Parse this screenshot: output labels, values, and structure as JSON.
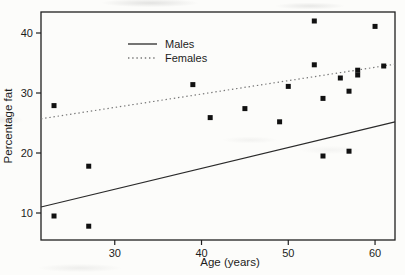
{
  "chart_data": {
    "type": "scatter",
    "title": "",
    "xlabel": "Age (years)",
    "ylabel": "Percentage fat",
    "xlim": [
      21.5,
      62.3
    ],
    "ylim": [
      5.5,
      43.5
    ],
    "x_ticks": [
      30,
      40,
      50,
      60
    ],
    "y_ticks": [
      10,
      20,
      30,
      40
    ],
    "grid": false,
    "legend_position": "upper-left-inside",
    "marker": "filled-black-square",
    "marker_size_px": 5,
    "points": [
      [
        23,
        9.5
      ],
      [
        23,
        27.9
      ],
      [
        27,
        7.8
      ],
      [
        27,
        17.8
      ],
      [
        39,
        31.4
      ],
      [
        41,
        25.9
      ],
      [
        45,
        27.4
      ],
      [
        49,
        25.2
      ],
      [
        50,
        31.1
      ],
      [
        53,
        34.7
      ],
      [
        53,
        42.0
      ],
      [
        54,
        19.5
      ],
      [
        54,
        29.1
      ],
      [
        56,
        32.5
      ],
      [
        57,
        20.3
      ],
      [
        57,
        30.3
      ],
      [
        58,
        33.0
      ],
      [
        58,
        33.8
      ],
      [
        60,
        41.1
      ],
      [
        61,
        34.5
      ]
    ],
    "series": [
      {
        "name": "Males",
        "line_style": "solid",
        "line_color": "#2a2a2a",
        "trend_x": [
          21.5,
          62.3
        ],
        "trend_y": [
          11.0,
          25.2
        ]
      },
      {
        "name": "Females",
        "line_style": "dotted",
        "line_color": "#777777",
        "trend_x": [
          21.5,
          62.3
        ],
        "trend_y": [
          25.7,
          34.8
        ]
      }
    ],
    "colors": {
      "marker": "#111111",
      "frame": "#1f1f1f",
      "background": "#fcfcfa",
      "text": "#1c1c1c"
    }
  }
}
